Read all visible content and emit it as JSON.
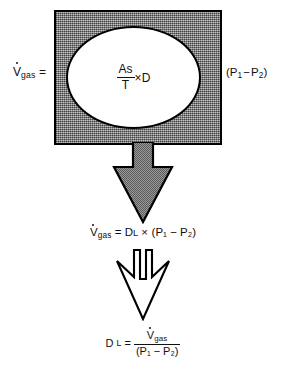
{
  "figure": {
    "colors": {
      "box_fill": "#8e8e8e",
      "box_stroke": "#000000",
      "ellipse_fill": "#ffffff",
      "arrow_gray_fill": "#8e8e8e",
      "arrow_white_fill": "#ffffff",
      "text": "#111111",
      "background": "#ffffff"
    }
  },
  "top_equation": {
    "left_side": {
      "variable": "V",
      "dot": "˙",
      "subscript": "gas",
      "equals": "="
    },
    "center_fraction": {
      "numerator": "As",
      "denominator": "T",
      "operator": "×",
      "factor": "D"
    },
    "right_side": {
      "open_paren": "(",
      "p1": "P",
      "p1_sub": "1",
      "minus": "−",
      "p2": "P",
      "p2_sub": "2",
      "close_paren": ")",
      "full": "(P₁ − P₂)"
    }
  },
  "middle_equation": {
    "v": "V",
    "v_sub": "gas",
    "equals": "=",
    "d": "D",
    "d_sub": "L",
    "times": "×",
    "paren_group": "(P₁ − P₂)",
    "full": "V̇gas = DL × (P₁ − P₂)"
  },
  "bottom_equation": {
    "d": "D",
    "d_sub": "L",
    "equals": "=",
    "numerator_v": "V",
    "numerator_sub": "gas",
    "denominator": "(P₁ − P₂)",
    "full": "DL = V̇gas / (P₁ − P₂)"
  },
  "arrows": [
    {
      "name": "gray-down-arrow",
      "style": "filled-gray",
      "direction": "down"
    },
    {
      "name": "white-down-arrow",
      "style": "outline-white-split",
      "direction": "down"
    }
  ]
}
